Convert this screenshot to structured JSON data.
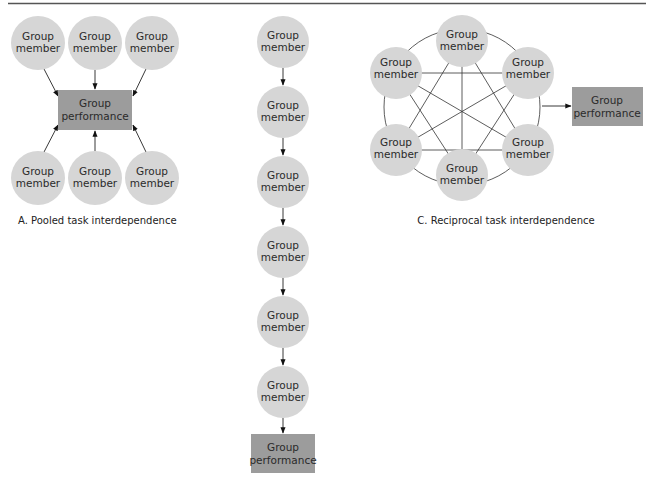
{
  "colors": {
    "member_fill": "#d6d6d6",
    "performance_fill": "#9c9c9c",
    "line": "#333333",
    "rule": "#555555",
    "text": "#2a2a2a"
  },
  "labels": {
    "member_line1": "Group",
    "member_line2": "member",
    "performance_line1": "Group",
    "performance_line2": "performance"
  },
  "diagrams": {
    "pooled": {
      "caption": "A. Pooled task interdependence",
      "members_top": 3,
      "members_bottom": 3
    },
    "sequential": {
      "caption": "",
      "members": 6
    },
    "reciprocal": {
      "caption": "C. Reciprocal task interdependence",
      "members": 6
    }
  }
}
